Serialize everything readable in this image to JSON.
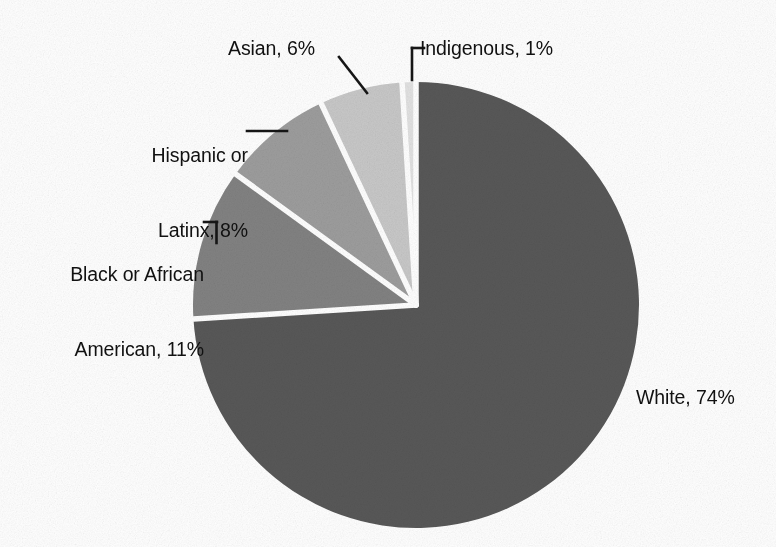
{
  "chart_data": {
    "type": "pie",
    "title": "",
    "subtitle": "",
    "xlabel": "",
    "ylabel": "",
    "legend_position": "none",
    "grid": false,
    "value_unit": "%",
    "categories": [
      "White",
      "Black or African American",
      "Hispanic or Latinx",
      "Asian",
      "Indigenous"
    ],
    "values": [
      74,
      11,
      8,
      6,
      1
    ],
    "slices": [
      {
        "name": "White",
        "value": 74,
        "label": "White, 74%",
        "color": "#585858"
      },
      {
        "name": "Black or African American",
        "value": 11,
        "label_line1": "Black or African",
        "label_line2": "American, 11%",
        "color": "#828282"
      },
      {
        "name": "Hispanic or Latinx",
        "value": 8,
        "label_line1": "Hispanic or",
        "label_line2": "Latinx, 8%",
        "color": "#9d9d9d"
      },
      {
        "name": "Asian",
        "value": 6,
        "label": "Asian, 6%",
        "color": "#c8c8c8"
      },
      {
        "name": "Indigenous",
        "value": 1,
        "label": "Indigenous, 1%",
        "color": "#e2e2e2"
      }
    ]
  },
  "labels": {
    "white": "White, 74%",
    "black_line1": "Black or African",
    "black_line2": "American, 11%",
    "hispanic_line1": "Hispanic or",
    "hispanic_line2": "Latinx, 8%",
    "asian": "Asian, 6%",
    "indigenous": "Indigenous, 1%"
  },
  "style": {
    "background": "#ffffff",
    "slice_separator": "#ffffff",
    "leader_line": "#161616",
    "text": "#111111"
  }
}
